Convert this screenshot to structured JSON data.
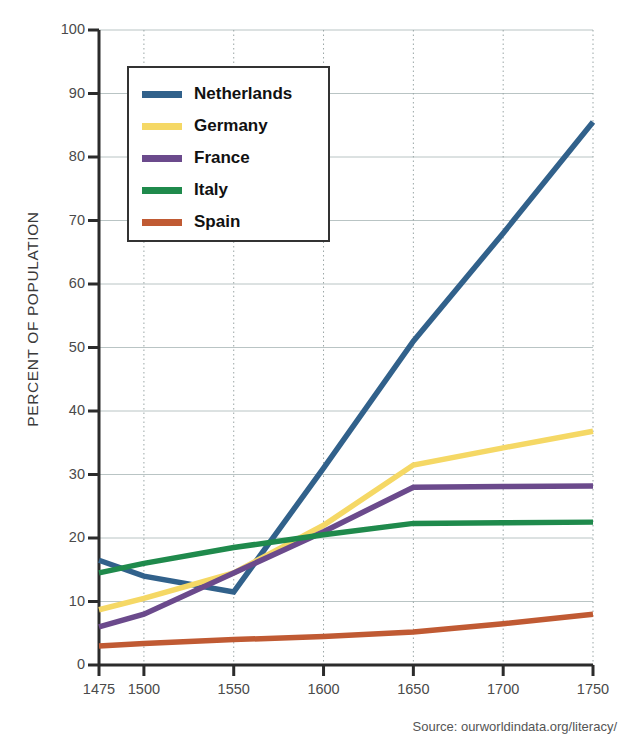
{
  "title": "",
  "source": "Source: ourworldindata.org/literacy/",
  "legend": {
    "items": [
      {
        "label": "Netherlands",
        "color": "#31618b"
      },
      {
        "label": "Germany",
        "color": "#f5d865"
      },
      {
        "label": "France",
        "color": "#6b4a8c"
      },
      {
        "label": "Italy",
        "color": "#1f8a4c"
      },
      {
        "label": "Spain",
        "color": "#c05a33"
      }
    ]
  },
  "axes": {
    "y_title": "PERCENT OF POPULATION",
    "y_ticks": [
      0,
      10,
      20,
      30,
      40,
      50,
      60,
      70,
      80,
      90,
      100
    ],
    "x_ticks": [
      1475,
      1500,
      1550,
      1600,
      1650,
      1700,
      1750
    ]
  },
  "chart_data": {
    "type": "line",
    "title": "",
    "xlabel": "",
    "ylabel": "PERCENT OF POPULATION",
    "xlim": [
      1475,
      1750
    ],
    "ylim": [
      0,
      100
    ],
    "grid": true,
    "legend_position": "top-left-inside",
    "x": [
      1475,
      1500,
      1550,
      1600,
      1650,
      1700,
      1750
    ],
    "series": [
      {
        "name": "Netherlands",
        "color": "#31618b",
        "values": [
          16.5,
          14.0,
          11.5,
          31.0,
          51.0,
          68.0,
          85.5
        ]
      },
      {
        "name": "Germany",
        "color": "#f5d865",
        "values": [
          8.7,
          10.5,
          14.5,
          22.0,
          31.5,
          34.2,
          36.8
        ]
      },
      {
        "name": "France",
        "color": "#6b4a8c",
        "values": [
          6.0,
          8.0,
          14.5,
          21.0,
          28.0,
          28.1,
          28.2
        ]
      },
      {
        "name": "Italy",
        "color": "#1f8a4c",
        "values": [
          14.5,
          16.0,
          18.5,
          20.5,
          22.3,
          22.4,
          22.5
        ]
      },
      {
        "name": "Spain",
        "color": "#c05a33",
        "values": [
          3.0,
          3.4,
          4.0,
          4.5,
          5.2,
          6.5,
          8.0
        ]
      }
    ]
  }
}
